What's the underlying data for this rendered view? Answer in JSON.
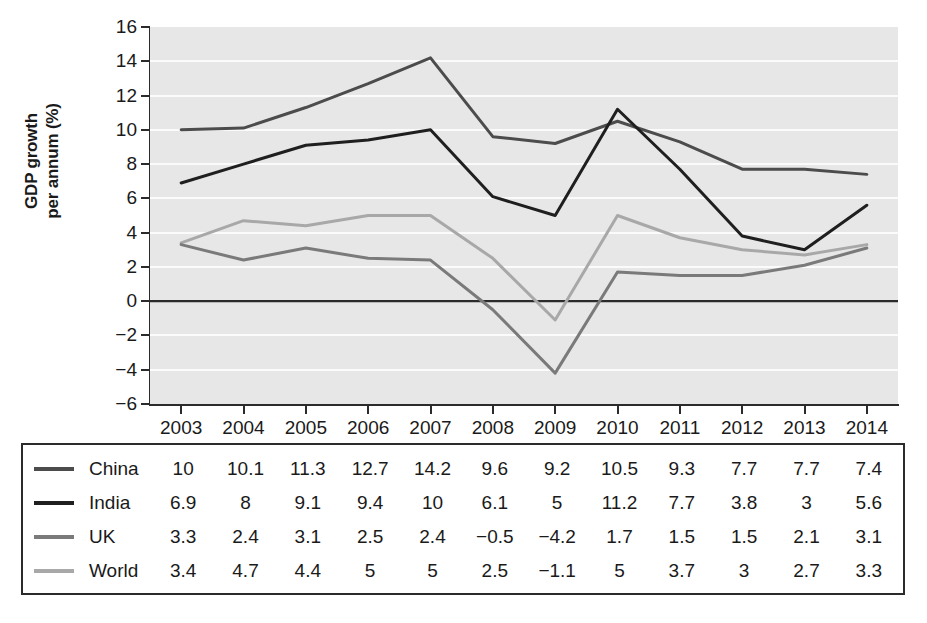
{
  "chart_data": {
    "type": "line",
    "title": "",
    "xlabel": "",
    "ylabel": "GDP growth\nper annum (%)",
    "categories": [
      "2003",
      "2004",
      "2005",
      "2006",
      "2007",
      "2008",
      "2009",
      "2010",
      "2011",
      "2012",
      "2013",
      "2014"
    ],
    "ylim": [
      -6,
      16
    ],
    "yticks": [
      16,
      14,
      12,
      10,
      8,
      6,
      4,
      2,
      0,
      -2,
      -4,
      -6
    ],
    "ytick_labels": [
      "16",
      "14",
      "12",
      "10",
      "8",
      "6",
      "4",
      "2",
      "0",
      "−2",
      "−4",
      "−6"
    ],
    "grid": "horizontal-white-on-grey",
    "legend_position": "bottom-table",
    "plot_background": "#e7e7e7",
    "series": [
      {
        "name": "China",
        "color": "#4c4c4c",
        "values": [
          10,
          10.1,
          11.3,
          12.7,
          14.2,
          9.6,
          9.2,
          10.5,
          9.3,
          7.7,
          7.7,
          7.4
        ],
        "value_labels": [
          "10",
          "10.1",
          "11.3",
          "12.7",
          "14.2",
          "9.6",
          "9.2",
          "10.5",
          "9.3",
          "7.7",
          "7.7",
          "7.4"
        ]
      },
      {
        "name": "India",
        "color": "#1f1f1f",
        "values": [
          6.9,
          8,
          9.1,
          9.4,
          10,
          6.1,
          5,
          11.2,
          7.7,
          3.8,
          3,
          5.6
        ],
        "value_labels": [
          "6.9",
          "8",
          "9.1",
          "9.4",
          "10",
          "6.1",
          "5",
          "11.2",
          "7.7",
          "3.8",
          "3",
          "5.6"
        ]
      },
      {
        "name": "UK",
        "color": "#7a7a7a",
        "values": [
          3.3,
          2.4,
          3.1,
          2.5,
          2.4,
          -0.5,
          -4.2,
          1.7,
          1.5,
          1.5,
          2.1,
          3.1
        ],
        "value_labels": [
          "3.3",
          "2.4",
          "3.1",
          "2.5",
          "2.4",
          "−0.5",
          "−4.2",
          "1.7",
          "1.5",
          "1.5",
          "2.1",
          "3.1"
        ]
      },
      {
        "name": "World",
        "color": "#a8a8a8",
        "values": [
          3.4,
          4.7,
          4.4,
          5,
          5,
          2.5,
          -1.1,
          5,
          3.7,
          3,
          2.7,
          3.3
        ],
        "value_labels": [
          "3.4",
          "4.7",
          "4.4",
          "5",
          "5",
          "2.5",
          "−1.1",
          "5",
          "3.7",
          "3",
          "2.7",
          "3.3"
        ]
      }
    ]
  }
}
